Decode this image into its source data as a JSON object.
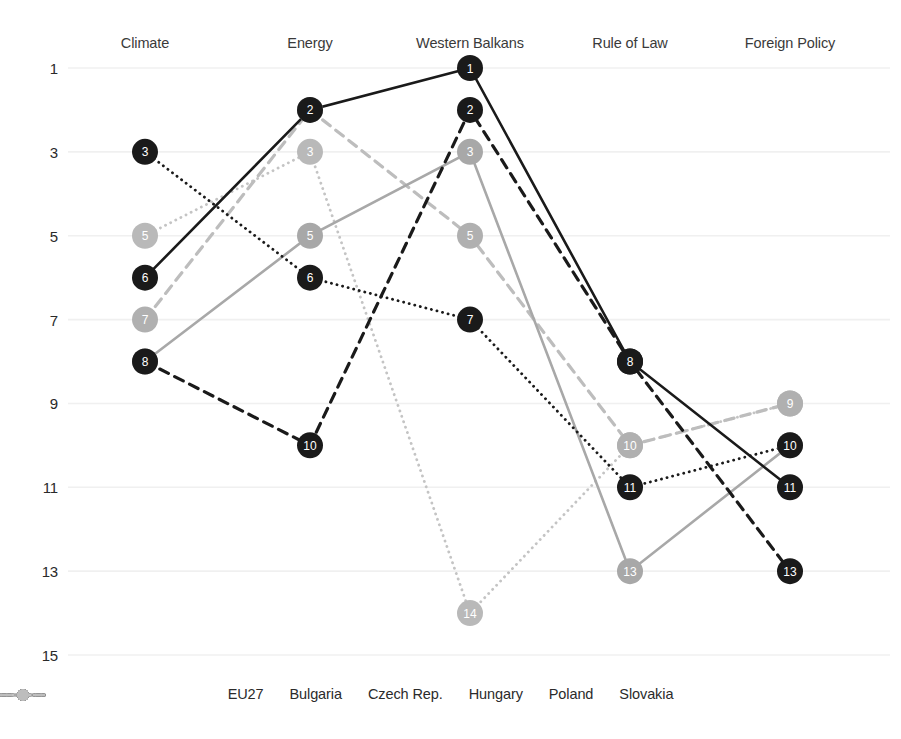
{
  "chart_data": {
    "type": "line",
    "title": "",
    "xlabel": "",
    "ylabel": "",
    "categories": [
      "Climate",
      "Energy",
      "Western Balkans",
      "Rule of Law",
      "Foreign Policy"
    ],
    "yticks": [
      1,
      3,
      5,
      7,
      9,
      11,
      13,
      15
    ],
    "ylim": [
      1,
      15
    ],
    "y_inverted": true,
    "grid": true,
    "legend_position": "bottom",
    "series": [
      {
        "name": "EU27",
        "color": "#1a1a1a",
        "line_style": "dotted",
        "marker_color": "#1a1a1a",
        "label_color": "#ffffff",
        "values": [
          3,
          6,
          7,
          11,
          10
        ]
      },
      {
        "name": "Bulgaria",
        "color": "#1a1a1a",
        "line_style": "solid",
        "marker_color": "#1a1a1a",
        "label_color": "#ffffff",
        "values": [
          6,
          2,
          1,
          8,
          11
        ]
      },
      {
        "name": "Czech Rep.",
        "color": "#a8a8a8",
        "line_style": "solid",
        "marker_color": "#a8a8a8",
        "label_color": "#ffffff",
        "values": [
          8,
          5,
          3,
          13,
          10
        ]
      },
      {
        "name": "Hungary",
        "color": "#1a1a1a",
        "line_style": "dashed",
        "marker_color": "#1a1a1a",
        "label_color": "#ffffff",
        "values": [
          8,
          10,
          2,
          8,
          13
        ]
      },
      {
        "name": "Poland",
        "color": "#c4c4c4",
        "line_style": "dotted",
        "marker_color": "#b9b9b9",
        "label_color": "#ffffff",
        "values": [
          5,
          3,
          14,
          10,
          9
        ]
      },
      {
        "name": "Slovakia",
        "color": "#bdbdbd",
        "line_style": "dashed",
        "marker_color": "#b0b0b0",
        "label_color": "#ffffff",
        "values": [
          7,
          2,
          5,
          10,
          9
        ]
      }
    ]
  },
  "axis": {
    "tick_labels": [
      "1",
      "3",
      "5",
      "7",
      "9",
      "11",
      "13",
      "15"
    ],
    "category_labels": [
      "Climate",
      "Energy",
      "Western Balkans",
      "Rule of Law",
      "Foreign Policy"
    ]
  },
  "legend": {
    "items": [
      {
        "label": "EU27",
        "color": "#1a1a1a",
        "style": "dotted"
      },
      {
        "label": "Bulgaria",
        "color": "#1a1a1a",
        "style": "solid"
      },
      {
        "label": "Czech Rep.",
        "color": "#a8a8a8",
        "style": "solid"
      },
      {
        "label": "Hungary",
        "color": "#1a1a1a",
        "style": "dashed"
      },
      {
        "label": "Poland",
        "color": "#c4c4c4",
        "style": "dotted"
      },
      {
        "label": "Slovakia",
        "color": "#bdbdbd",
        "style": "dashed"
      }
    ]
  },
  "colors": {
    "gridline": "#f0f0f0",
    "background": "#ffffff",
    "text": "#2a2a2a"
  }
}
